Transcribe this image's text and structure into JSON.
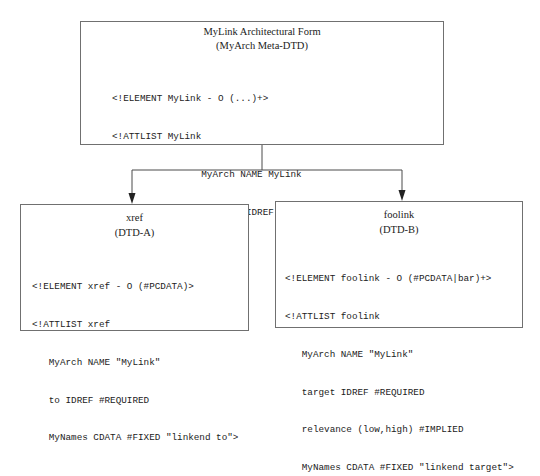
{
  "diagram": {
    "top": {
      "title": "MyLink Architectural Form",
      "subtitle": "(MyArch Meta-DTD)",
      "code": [
        "<!ELEMENT MyLink - O (...)+>",
        "<!ATTLIST MyLink",
        "                MyArch NAME MyLink",
        "                LinkEnd IDREF #REQUIRED>"
      ]
    },
    "left": {
      "title": "xref",
      "subtitle": "(DTD-A)",
      "code": [
        "<!ELEMENT xref - O (#PCDATA)>",
        "<!ATTLIST xref",
        "   MyArch NAME \"MyLink\"",
        "   to IDREF #REQUIRED",
        "   MyNames CDATA #FIXED \"linkend to\">"
      ]
    },
    "right": {
      "title": "foolink",
      "subtitle": "(DTD-B)",
      "code": [
        "<!ELEMENT foolink - O (#PCDATA|bar)+>",
        "<!ATTLIST foolink",
        "   MyArch NAME \"MyLink\"",
        "   target IDREF #REQUIRED",
        "   relevance (low,high) #IMPLIED",
        "   MyNames CDATA #FIXED \"linkend target\">"
      ]
    },
    "edges": [
      {
        "from": "top",
        "to": "left"
      },
      {
        "from": "top",
        "to": "right"
      }
    ],
    "colors": {
      "stroke": "#4a4a4a",
      "border": "#707070",
      "text": "#222222"
    }
  }
}
